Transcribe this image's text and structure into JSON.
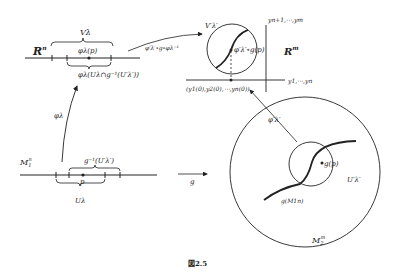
{
  "figure": {
    "caption": "図2.5",
    "labels": {
      "Rn": "R",
      "Rn_sup": "n",
      "V_lambda": "Vλ",
      "phi_p": "φλ(p)",
      "phi_U": "φλ(Uλ∩g⁻¹(U′λ′))",
      "transition_map": "φ′λ′∘g∘φλ⁻¹",
      "V_prime": "V′λ′",
      "phi_prime_g_p": "φ′λ′∘g(p)",
      "Rm": "R",
      "Rm_sup": "m",
      "y_upper": "yn+1,⋯,ym",
      "y_lower": "y1,⋯,yn",
      "y0": "(y1(0),y2(0),⋯,yn(0))",
      "phi_lambda": "φλ",
      "phi_prime": "φ′λ′",
      "M1": "M",
      "M1_sub": "1",
      "M1_sup": "n",
      "g_inv_U": "g⁻¹(U′λ′)",
      "p": "p",
      "U_lambda": "Uλ",
      "g_map": "g",
      "g_p": "g(p)",
      "U_prime": "U′λ′",
      "g_M1": "g(M1n)",
      "M2": "M",
      "M2_sub": "2",
      "M2_sup": "m"
    }
  }
}
